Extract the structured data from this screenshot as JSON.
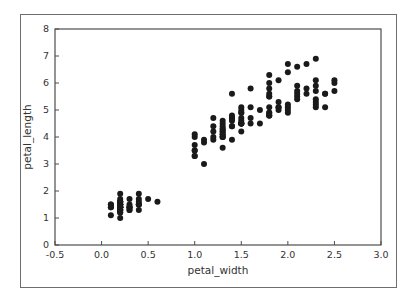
{
  "figure": {
    "background_color": "#ffffff",
    "frame_color": "#6e6e6e",
    "axes_color": "#4d4d4d",
    "tick_label_color": "#333333",
    "marker_color": "#1a1a1a"
  },
  "chart_data": {
    "type": "scatter",
    "title": "",
    "xlabel": "petal_width",
    "ylabel": "petal_length",
    "xlim": [
      -0.5,
      3.0
    ],
    "ylim": [
      0,
      8
    ],
    "xticks": [
      -0.5,
      0.0,
      0.5,
      1.0,
      1.5,
      2.0,
      2.5,
      3.0
    ],
    "xtick_labels": [
      "-0.5",
      "0.0",
      "0.5",
      "1.0",
      "1.5",
      "2.0",
      "2.5",
      "3.0"
    ],
    "yticks": [
      0,
      1,
      2,
      3,
      4,
      5,
      6,
      7,
      8
    ],
    "ytick_labels": [
      "0",
      "1",
      "2",
      "3",
      "4",
      "5",
      "6",
      "7",
      "8"
    ],
    "grid": false,
    "legend": null,
    "marker": "circle",
    "marker_size": 6,
    "marker_color": "#1a1a1a",
    "series": [
      {
        "name": "petal measurements",
        "x": [
          0.2,
          0.2,
          0.2,
          0.2,
          0.2,
          0.4,
          0.3,
          0.2,
          0.2,
          0.1,
          0.2,
          0.2,
          0.1,
          0.1,
          0.2,
          0.4,
          0.4,
          0.3,
          0.3,
          0.3,
          0.2,
          0.4,
          0.2,
          0.5,
          0.2,
          0.2,
          0.4,
          0.2,
          0.2,
          0.2,
          0.2,
          0.4,
          0.1,
          0.2,
          0.2,
          0.2,
          0.2,
          0.1,
          0.2,
          0.2,
          0.3,
          0.3,
          0.2,
          0.6,
          0.4,
          0.3,
          0.2,
          0.2,
          0.2,
          0.2,
          1.4,
          1.5,
          1.5,
          1.3,
          1.5,
          1.3,
          1.6,
          1.0,
          1.3,
          1.4,
          1.0,
          1.5,
          1.0,
          1.4,
          1.3,
          1.4,
          1.5,
          1.0,
          1.5,
          1.1,
          1.8,
          1.3,
          1.5,
          1.2,
          1.3,
          1.4,
          1.4,
          1.7,
          1.5,
          1.0,
          1.1,
          1.0,
          1.2,
          1.6,
          1.5,
          1.6,
          1.5,
          1.3,
          1.3,
          1.3,
          1.2,
          1.4,
          1.2,
          1.0,
          1.3,
          1.2,
          1.3,
          1.3,
          1.1,
          1.3,
          2.5,
          1.9,
          2.1,
          1.8,
          2.2,
          2.1,
          1.7,
          1.8,
          1.8,
          2.5,
          2.0,
          1.9,
          2.1,
          2.0,
          2.4,
          2.3,
          1.8,
          2.2,
          2.3,
          1.5,
          2.3,
          2.0,
          2.0,
          1.8,
          2.1,
          1.8,
          1.8,
          1.8,
          2.1,
          1.6,
          1.9,
          2.0,
          2.2,
          1.5,
          1.4,
          2.3,
          2.4,
          1.8,
          1.8,
          2.1,
          2.4,
          2.3,
          1.9,
          2.3,
          2.5,
          2.3,
          1.9,
          2.0,
          2.3,
          1.8
        ],
        "y": [
          1.4,
          1.4,
          1.3,
          1.5,
          1.4,
          1.7,
          1.4,
          1.5,
          1.4,
          1.5,
          1.5,
          1.6,
          1.4,
          1.1,
          1.2,
          1.5,
          1.3,
          1.4,
          1.7,
          1.5,
          1.7,
          1.5,
          1.0,
          1.7,
          1.9,
          1.6,
          1.6,
          1.5,
          1.4,
          1.6,
          1.6,
          1.5,
          1.5,
          1.4,
          1.5,
          1.2,
          1.3,
          1.4,
          1.3,
          1.5,
          1.3,
          1.3,
          1.3,
          1.6,
          1.9,
          1.4,
          1.6,
          1.4,
          1.5,
          1.4,
          4.7,
          4.5,
          4.9,
          4.0,
          4.6,
          4.5,
          4.7,
          3.3,
          4.6,
          3.9,
          3.5,
          4.2,
          4.0,
          4.7,
          3.6,
          4.4,
          4.5,
          4.1,
          4.5,
          3.9,
          4.8,
          4.0,
          4.9,
          4.7,
          4.3,
          4.4,
          4.8,
          5.0,
          4.5,
          3.5,
          3.8,
          3.7,
          3.9,
          5.1,
          4.5,
          4.5,
          4.7,
          4.4,
          4.1,
          4.0,
          4.4,
          4.6,
          4.0,
          3.3,
          4.2,
          4.2,
          4.2,
          4.3,
          3.0,
          4.1,
          6.0,
          5.1,
          5.9,
          5.6,
          5.8,
          6.6,
          4.5,
          6.3,
          5.8,
          6.1,
          5.1,
          5.3,
          5.5,
          5.0,
          5.1,
          5.3,
          5.5,
          6.7,
          6.9,
          5.0,
          5.7,
          4.9,
          6.7,
          4.9,
          5.7,
          6.0,
          4.8,
          4.9,
          5.6,
          5.8,
          6.1,
          6.4,
          5.6,
          5.1,
          5.6,
          6.1,
          5.6,
          5.5,
          4.8,
          5.4,
          5.6,
          5.1,
          5.1,
          5.9,
          5.7,
          5.2,
          5.0,
          5.2,
          5.4,
          5.1
        ]
      }
    ]
  }
}
